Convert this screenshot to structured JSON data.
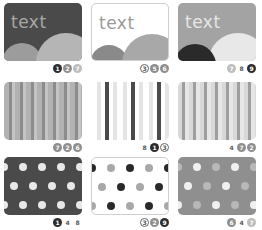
{
  "colors": {
    "dark": "#4a4a4a",
    "mid": "#8f8f8f",
    "light": "#b5b5b5",
    "pale": "#e6e6e6",
    "black": "#2a2a2a",
    "white": "#ffffff"
  },
  "cards": [
    {
      "id": "card-1",
      "type": "text-hills",
      "text": "text",
      "badges": [
        {
          "n": "1",
          "style": "dark"
        },
        {
          "n": "2",
          "style": "mid"
        },
        {
          "n": "7",
          "style": "light"
        }
      ]
    },
    {
      "id": "card-2",
      "type": "text-hills",
      "text": "text",
      "badges": [
        {
          "n": "3",
          "style": "outline"
        },
        {
          "n": "5",
          "style": "mid"
        },
        {
          "n": "6",
          "style": "mid"
        }
      ]
    },
    {
      "id": "card-3",
      "type": "text-hills",
      "text": "text",
      "badges": [
        {
          "n": "7",
          "style": "light"
        },
        {
          "n": "8",
          "style": "plain"
        },
        {
          "n": "9",
          "style": "dark"
        }
      ]
    },
    {
      "id": "card-4",
      "type": "stripes",
      "badges": [
        {
          "n": "7",
          "style": "mid"
        },
        {
          "n": "2",
          "style": "mid"
        },
        {
          "n": "6",
          "style": "mid"
        }
      ]
    },
    {
      "id": "card-5",
      "type": "stripes",
      "badges": [
        {
          "n": "8",
          "style": "plain"
        },
        {
          "n": "1",
          "style": "dark"
        },
        {
          "n": "3",
          "style": "outline"
        }
      ]
    },
    {
      "id": "card-6",
      "type": "stripes",
      "badges": [
        {
          "n": "4",
          "style": "plain"
        },
        {
          "n": "7",
          "style": "mid"
        },
        {
          "n": "2",
          "style": "mid"
        }
      ]
    },
    {
      "id": "card-7",
      "type": "dots",
      "badges": [
        {
          "n": "1",
          "style": "dark"
        },
        {
          "n": "4",
          "style": "plain"
        },
        {
          "n": "8",
          "style": "plain"
        }
      ]
    },
    {
      "id": "card-8",
      "type": "dots",
      "badges": [
        {
          "n": "3",
          "style": "outline"
        },
        {
          "n": "2",
          "style": "mid"
        },
        {
          "n": "9",
          "style": "dark"
        }
      ]
    },
    {
      "id": "card-9",
      "type": "dots",
      "badges": [
        {
          "n": "6",
          "style": "mid"
        },
        {
          "n": "4",
          "style": "plain"
        },
        {
          "n": "7",
          "style": "light"
        }
      ]
    }
  ]
}
